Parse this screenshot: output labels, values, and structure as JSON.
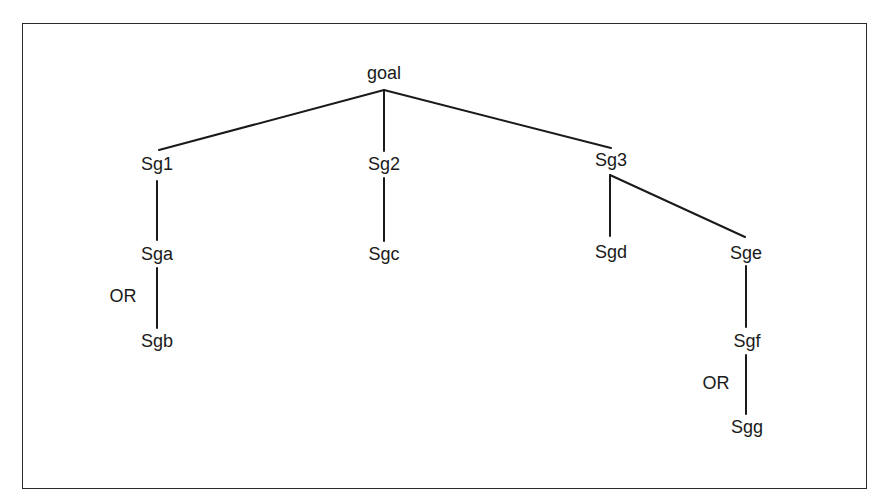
{
  "diagram": {
    "type": "goal-decomposition-tree",
    "nodes": {
      "goal": {
        "label": "goal",
        "x": 384,
        "y": 73
      },
      "sg1": {
        "label": "Sg1",
        "x": 157,
        "y": 163
      },
      "sg2": {
        "label": "Sg2",
        "x": 384,
        "y": 163
      },
      "sg3": {
        "label": "Sg3",
        "x": 611,
        "y": 158
      },
      "sga": {
        "label": "Sga",
        "x": 157,
        "y": 253
      },
      "sgb": {
        "label": "Sgb",
        "x": 157,
        "y": 342
      },
      "sgc": {
        "label": "Sgc",
        "x": 384,
        "y": 253
      },
      "sgd": {
        "label": "Sgd",
        "x": 611,
        "y": 253
      },
      "sge": {
        "label": "Sge",
        "x": 745,
        "y": 253
      },
      "sgf": {
        "label": "Sgf",
        "x": 746,
        "y": 342
      },
      "sgg": {
        "label": "Sgg",
        "x": 746,
        "y": 427
      }
    },
    "edges": [
      {
        "from": "goal",
        "to": "Sg1"
      },
      {
        "from": "goal",
        "to": "Sg2"
      },
      {
        "from": "goal",
        "to": "Sg3"
      },
      {
        "from": "Sg1",
        "to": "Sga"
      },
      {
        "from": "Sga",
        "to": "Sgb",
        "relation": "OR"
      },
      {
        "from": "Sg2",
        "to": "Sgc"
      },
      {
        "from": "Sg3",
        "to": "Sgd"
      },
      {
        "from": "Sg3",
        "to": "Sge"
      },
      {
        "from": "Sge",
        "to": "Sgf"
      },
      {
        "from": "Sgf",
        "to": "Sgg",
        "relation": "OR"
      }
    ],
    "or_labels": [
      {
        "label": "OR",
        "between": [
          "Sga",
          "Sgb"
        ],
        "x": 124,
        "y": 297
      },
      {
        "label": "OR",
        "between": [
          "Sgf",
          "Sgg"
        ],
        "x": 716,
        "y": 383
      }
    ],
    "colors": {
      "line": "#1a1a1a",
      "text": "#1a1a1a",
      "frame": "#2a2a2a",
      "background": "#ffffff"
    }
  }
}
